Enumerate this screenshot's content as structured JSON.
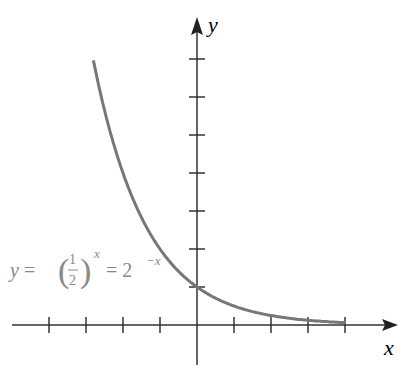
{
  "chart_data": {
    "type": "line",
    "title": "",
    "xlabel": "x",
    "ylabel": "y",
    "series": [
      {
        "name": "y = (1/2)^x = 2^-x",
        "x": [
          -2.8,
          -2.5,
          -2,
          -1.5,
          -1,
          -0.5,
          0,
          0.5,
          1,
          1.5,
          2,
          2.5,
          3,
          3.5,
          4
        ],
        "values": [
          6.96,
          5.66,
          4,
          2.83,
          2,
          1.41,
          1,
          0.71,
          0.5,
          0.35,
          0.25,
          0.18,
          0.125,
          0.09,
          0.0625
        ]
      }
    ],
    "xlim": [
      -5,
      5
    ],
    "ylim": [
      -1,
      8
    ],
    "x_ticks": [
      -4,
      -3,
      -2,
      -1,
      1,
      2,
      3,
      4
    ],
    "y_ticks": [
      1,
      2,
      3,
      4,
      5,
      6,
      7
    ],
    "grid": false,
    "annotations": [
      "y = (1/2)^x = 2^-x"
    ]
  },
  "labels": {
    "x": "x",
    "y": "y",
    "eq_y": "y =",
    "eq_num": "1",
    "eq_den": "2",
    "eq_exp": "x",
    "eq_rhs": "= 2",
    "eq_rhs_exp": "−x"
  }
}
